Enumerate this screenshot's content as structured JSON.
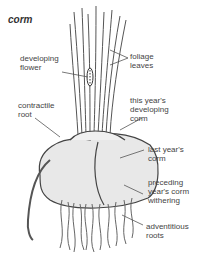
{
  "title": "corm",
  "labels": {
    "developing_flower": "developing\nflower",
    "foliage_leaves": "foliage\nleaves",
    "this_years_corm": "this year's\ndeveloping\ncorm",
    "contractile_root": "contractile\nroot",
    "last_years_corm": "last year's\ncorm",
    "preceding_corm": "preceding\nyear's corm\nwithering",
    "adventitious_roots": "adventitious\nroots"
  },
  "colors": {
    "ink": "#444444",
    "fill": "#e6e6e6",
    "background": "#ffffff"
  }
}
